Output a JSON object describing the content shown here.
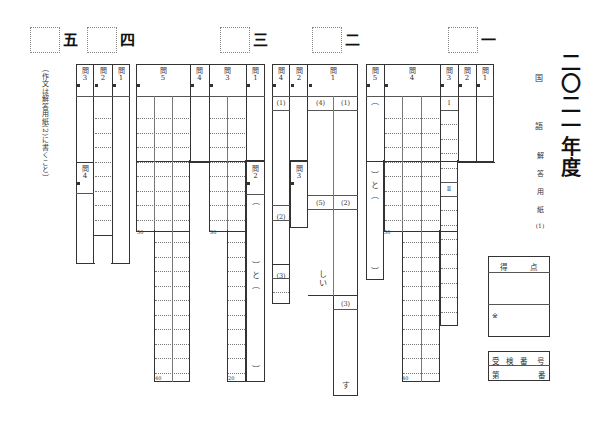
{
  "document": {
    "title": "二〇二一年度",
    "subject_chars": [
      "国",
      "語"
    ],
    "sheet_chars": [
      "解",
      "答",
      "用",
      "紙",
      "(1)"
    ],
    "essay_note": "（作文は解答用紙(2)に書くこと）"
  },
  "sections": [
    {
      "num": "一",
      "x": 448,
      "y": 27
    },
    {
      "num": "二",
      "x": 312,
      "y": 27
    },
    {
      "num": "三",
      "x": 220,
      "y": 27
    },
    {
      "num": "四",
      "x": 87,
      "y": 27
    },
    {
      "num": "五",
      "x": 30,
      "y": 27
    }
  ],
  "questions": {
    "q_label_char": "問",
    "labels": [
      {
        "id": "s5-q3",
        "num": "3",
        "x": 76,
        "y": 64,
        "w": 18
      },
      {
        "id": "s5-q2",
        "num": "2",
        "x": 94,
        "y": 64,
        "w": 18
      },
      {
        "id": "s5-q1",
        "num": "1",
        "x": 112,
        "y": 64,
        "w": 18
      },
      {
        "id": "s5-q4",
        "num": "4",
        "x": 76,
        "y": 162,
        "w": 18
      },
      {
        "id": "s4-q5",
        "num": "5",
        "x": 136,
        "y": 64,
        "w": 54
      },
      {
        "id": "s4-q4",
        "num": "4",
        "x": 190,
        "y": 64,
        "w": 19
      },
      {
        "id": "s4-q3",
        "num": "3",
        "x": 209,
        "y": 64,
        "w": 37
      },
      {
        "id": "s4-q1",
        "num": "1",
        "x": 246,
        "y": 64,
        "w": 19
      },
      {
        "id": "s4-q2",
        "num": "2",
        "x": 246,
        "y": 162,
        "w": 19
      },
      {
        "id": "s3-q4",
        "num": "4",
        "x": 272,
        "y": 64,
        "w": 18
      },
      {
        "id": "s3-q2",
        "num": "2",
        "x": 290,
        "y": 64,
        "w": 18
      },
      {
        "id": "s3-q1",
        "num": "1",
        "x": 308,
        "y": 64,
        "w": 50
      },
      {
        "id": "s3-q3",
        "num": "3",
        "x": 290,
        "y": 162,
        "w": 18
      },
      {
        "id": "s1-q5",
        "num": "5",
        "x": 366,
        "y": 64,
        "w": 18
      },
      {
        "id": "s1-q4",
        "num": "4",
        "x": 384,
        "y": 64,
        "w": 56
      },
      {
        "id": "s1-q3",
        "num": "3",
        "x": 440,
        "y": 64,
        "w": 18
      },
      {
        "id": "s1-q2",
        "num": "2",
        "x": 458,
        "y": 64,
        "w": 18
      },
      {
        "id": "s1-q1",
        "num": "1",
        "x": 476,
        "y": 64,
        "w": 18
      }
    ]
  },
  "subparts": [
    {
      "label": "(1)",
      "x": 272,
      "y": 96,
      "w": 18
    },
    {
      "label": "(4)",
      "x": 308,
      "y": 96,
      "w": 25
    },
    {
      "label": "(1)",
      "x": 333,
      "y": 96,
      "w": 25
    },
    {
      "label": "(2)",
      "x": 272,
      "y": 210,
      "w": 18
    },
    {
      "label": "(5)",
      "x": 308,
      "y": 196,
      "w": 25
    },
    {
      "label": "(2)",
      "x": 333,
      "y": 196,
      "w": 25
    },
    {
      "label": "(3)",
      "x": 272,
      "y": 269,
      "w": 18
    },
    {
      "label": "(3)",
      "x": 333,
      "y": 297,
      "w": 25
    },
    {
      "label": "Ⅰ",
      "x": 440,
      "y": 96,
      "w": 18
    },
    {
      "label": "Ⅱ",
      "x": 440,
      "y": 182,
      "w": 18
    }
  ],
  "fill_text": {
    "shii": "しい",
    "su": "す",
    "to": "と",
    "open_paren": "︵",
    "close_paren": "︶"
  },
  "char_counts": [
    {
      "label": "50",
      "x": 137,
      "y": 230
    },
    {
      "label": "40",
      "x": 155,
      "y": 376
    },
    {
      "label": "30",
      "x": 210,
      "y": 230
    },
    {
      "label": "20",
      "x": 228,
      "y": 376
    },
    {
      "label": "50",
      "x": 384,
      "y": 230
    },
    {
      "label": "40",
      "x": 402,
      "y": 376
    }
  ],
  "score": {
    "header_left": "得",
    "header_right": "点",
    "note_mark": "※"
  },
  "exam_number": {
    "header": [
      "受",
      "検",
      "番",
      "号"
    ],
    "prefix": "第",
    "suffix": "番"
  }
}
